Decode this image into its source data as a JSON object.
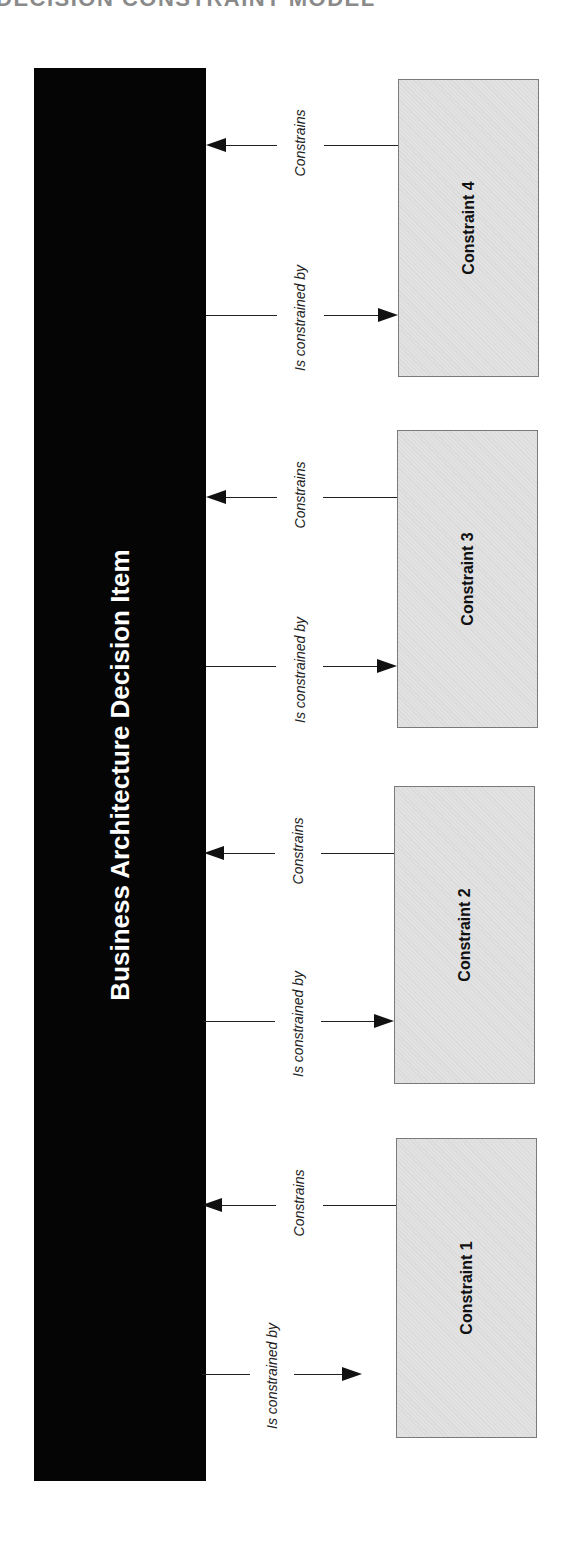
{
  "page_title": "DECISION CONSTRAINT MODEL",
  "main_item": {
    "label": "Business Architecture Decision Item"
  },
  "relations": {
    "constrains": "Constrains",
    "is_constrained_by": "Is constrained by"
  },
  "constraints": [
    {
      "label": "Constraint 4"
    },
    {
      "label": "Constraint 3"
    },
    {
      "label": "Constraint 2"
    },
    {
      "label": "Constraint 1"
    }
  ],
  "colors": {
    "main_bar": "#050505",
    "box_fill": "#e2e2e2",
    "box_border": "#7a7a7a"
  }
}
